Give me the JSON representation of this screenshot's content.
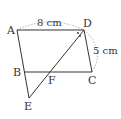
{
  "diagram": {
    "type": "geometry",
    "shape": "parallelogram ABCD with extension",
    "points": {
      "A": {
        "label": "A",
        "x": 17,
        "y": 30
      },
      "B": {
        "label": "B",
        "x": 24,
        "y": 72
      },
      "C": {
        "label": "C",
        "x": 92,
        "y": 72
      },
      "D": {
        "label": "D",
        "x": 84,
        "y": 30
      },
      "E": {
        "label": "E",
        "x": 29,
        "y": 98
      },
      "F": {
        "label": "F",
        "x": 50,
        "y": 72
      }
    },
    "dimensions": {
      "AD": "8 cm",
      "DC": "5 cm"
    },
    "angle_marks": "equal-angle dots at D (angle bisector DE)",
    "colors": {
      "line": "#333333",
      "dashed_arc": "#999999"
    }
  }
}
